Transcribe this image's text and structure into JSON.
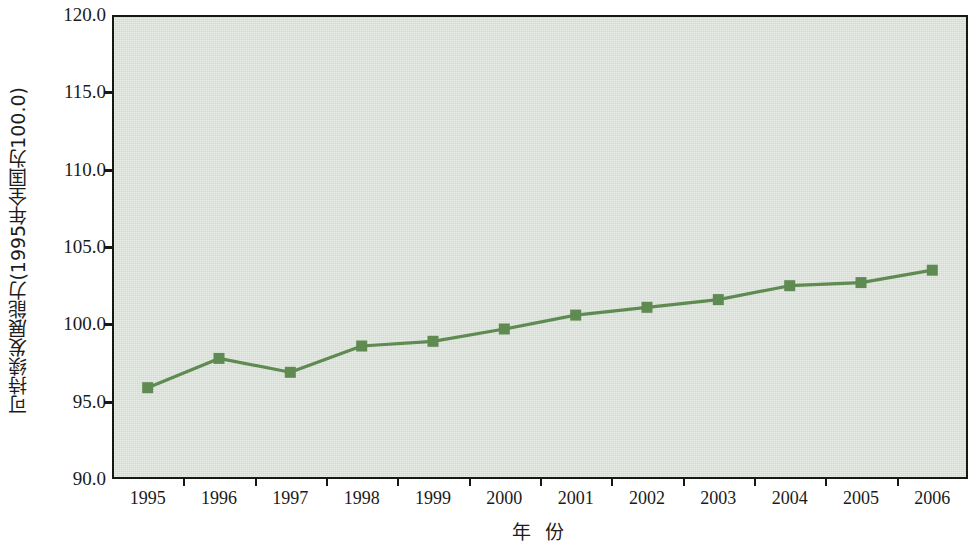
{
  "chart_data": {
    "type": "line",
    "title": "",
    "subtitle": "",
    "xlabel": "年  份",
    "ylabel": "可持续发展能力(1995年全国为100.0)",
    "categories": [
      "1995",
      "1996",
      "1997",
      "1998",
      "1999",
      "2000",
      "2001",
      "2002",
      "2003",
      "2004",
      "2005",
      "2006"
    ],
    "values": [
      95.9,
      97.8,
      96.9,
      98.6,
      98.9,
      99.7,
      100.6,
      101.1,
      101.6,
      102.5,
      102.7,
      103.5
    ],
    "series": [
      {
        "name": "可持续发展能力",
        "values": [
          95.9,
          97.8,
          96.9,
          98.6,
          98.9,
          99.7,
          100.6,
          101.1,
          101.6,
          102.5,
          102.7,
          103.5
        ]
      }
    ],
    "ylim": [
      90.0,
      120.0
    ],
    "ytick_labels": [
      "120.0",
      "115.0",
      "110.0",
      "105.0",
      "100.0",
      "95.0",
      "90.0"
    ],
    "ytick_values": [
      120.0,
      115.0,
      110.0,
      105.0,
      100.0,
      95.0,
      90.0
    ],
    "xtick_labels": [
      "1995",
      "1996",
      "1997",
      "1998",
      "1999",
      "2000",
      "2001",
      "2002",
      "2003",
      "2004",
      "2005",
      "2006"
    ],
    "grid": false,
    "legend": "none",
    "legend_position": "none",
    "marker": "square",
    "annotations": []
  },
  "style": {
    "plot_background": "#cfdccd",
    "page_background": "#ffffff",
    "axis_color": "#16190f",
    "series_color": "#5f8a51",
    "marker_color": "#5f8a51",
    "text_color": "#1a1a1a"
  }
}
